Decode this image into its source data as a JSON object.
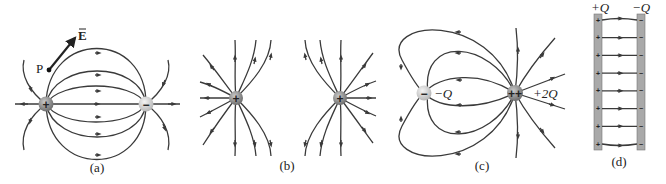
{
  "figure": {
    "panels": [
      {
        "id": "a",
        "caption": "(a)",
        "description": "Electric field lines of an electric dipole",
        "charges": [
          {
            "sign": "+",
            "label": ""
          },
          {
            "sign": "−",
            "label": ""
          }
        ],
        "point_label": "P",
        "vector_label": "E"
      },
      {
        "id": "b",
        "caption": "(b)",
        "description": "Electric field lines of two equal positive charges",
        "charges": [
          {
            "sign": "+",
            "label": ""
          },
          {
            "sign": "+",
            "label": ""
          }
        ]
      },
      {
        "id": "c",
        "caption": "(c)",
        "description": "Electric field lines of charges −Q and +2Q",
        "charges": [
          {
            "sign": "−",
            "label": "−Q"
          },
          {
            "sign": "++",
            "label": "+2Q"
          }
        ]
      },
      {
        "id": "d",
        "caption": "(d)",
        "description": "Electric field between two parallel plates",
        "plates": [
          {
            "label": "+Q",
            "sign": "+"
          },
          {
            "label": "−Q",
            "sign": "−"
          }
        ],
        "field_line_count": 8
      }
    ],
    "colors": {
      "line": "#3a3a3a",
      "positive_charge": "#8a8a8a",
      "negative_charge": "#d8d8d8",
      "plate": "#a9a9a9"
    }
  }
}
